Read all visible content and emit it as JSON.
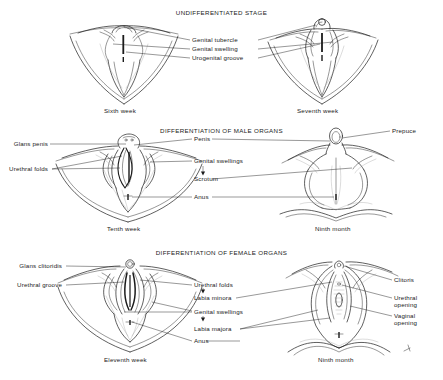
{
  "figure": {
    "sections": [
      {
        "id": "undifferentiated",
        "heading": "UNDIFFERENTIATED STAGE",
        "center_labels": [
          {
            "text": "Genital tubercle"
          },
          {
            "text": "Genital swelling"
          },
          {
            "text": "Urogenital groove"
          }
        ],
        "left_labels": [],
        "right_labels": [],
        "captions": [
          {
            "text": "Sixth week"
          },
          {
            "text": "Seventh week"
          }
        ]
      },
      {
        "id": "male",
        "heading": "DIFFERENTIATION OF MALE ORGANS",
        "left_labels": [
          {
            "text": "Glans penis"
          },
          {
            "text": "Urethral folds"
          }
        ],
        "center_labels": [
          {
            "text": "Penis"
          },
          {
            "text": "Genital swellings"
          },
          {
            "text": "Scrotum"
          },
          {
            "text": "Anus"
          }
        ],
        "right_labels": [
          {
            "text": "Prepuce"
          }
        ],
        "captions": [
          {
            "text": "Tenth week"
          },
          {
            "text": "Ninth month"
          }
        ]
      },
      {
        "id": "female",
        "heading": "DIFFERENTIATION OF FEMALE ORGANS",
        "left_labels": [
          {
            "text": "Glans clitoridis"
          },
          {
            "text": "Urethral groove"
          }
        ],
        "center_labels": [
          {
            "text": "Urethral folds"
          },
          {
            "text": "Labia minora"
          },
          {
            "text": "Genital swellings"
          },
          {
            "text": "Labia majora"
          },
          {
            "text": "Anus"
          }
        ],
        "right_labels": [
          {
            "text": "Clitoris"
          },
          {
            "text": "Urethral opening"
          },
          {
            "text": "Vaginal opening"
          }
        ],
        "captions": [
          {
            "text": "Eleventh week"
          },
          {
            "text": "Ninth month"
          }
        ]
      }
    ],
    "colors": {
      "ink": "#1b1b1b",
      "background": "#ffffff",
      "shading": "#9a9a9a"
    }
  }
}
